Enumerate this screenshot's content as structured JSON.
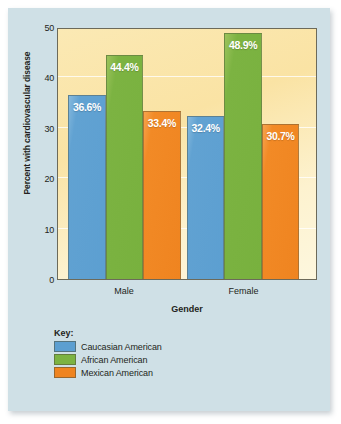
{
  "chart_data": {
    "type": "bar",
    "title": "",
    "xlabel": "Gender",
    "ylabel": "Percent with cardiovascular disease",
    "categories": [
      "Male",
      "Female"
    ],
    "series": [
      {
        "name": "Caucasian American",
        "color": "#5c9fd1",
        "values": [
          36.6,
          32.4
        ],
        "labels": [
          "36.6%",
          "32.4%"
        ]
      },
      {
        "name": "African American",
        "color": "#7cb342",
        "values": [
          44.4,
          48.9
        ],
        "labels": [
          "44.4%",
          "48.9%"
        ]
      },
      {
        "name": "Mexican American",
        "color": "#ef8420",
        "values": [
          33.4,
          30.7
        ],
        "labels": [
          "33.4%",
          "30.7%"
        ]
      }
    ],
    "ylim": [
      0,
      50
    ],
    "yticks": [
      0,
      10,
      20,
      30,
      40,
      50
    ],
    "ytick_labels": [
      "0",
      "10",
      "20",
      "30",
      "40",
      "50"
    ],
    "grid": true,
    "legend_position": "below-plot-left",
    "legend_title": "Key:",
    "plot_background": "#fae3a4",
    "card_background": "#cfe0e6"
  }
}
